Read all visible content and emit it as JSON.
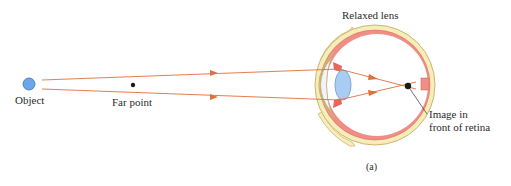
{
  "figure": {
    "panel_label": "(a)",
    "labels": {
      "object": "Object",
      "far_point": "Far point",
      "relaxed_lens": "Relaxed lens",
      "image_line1": "Image in",
      "image_line2": "front of retina"
    },
    "colors": {
      "object_fill": "#6aa6e8",
      "object_stroke": "#3d6fae",
      "ray": "#e0703c",
      "axis_start": "#7cbf4a",
      "axis_end": "#6c6fd6",
      "sclera_fill": "#f7edb8",
      "sclera_stroke": "#c9b774",
      "choroid": "#ef8e84",
      "lens_fill": "#a9cdf2",
      "lens_stroke": "#7aa8d8",
      "dot": "#1a1a1a"
    }
  }
}
